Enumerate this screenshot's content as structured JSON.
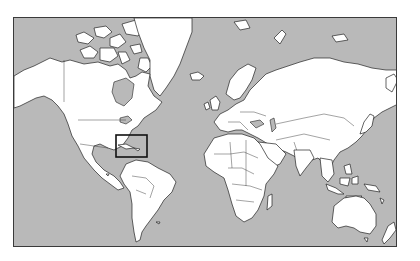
{
  "map": {
    "projection": "mercator",
    "style": "grayscale outline",
    "colors": {
      "ocean": "#b9b9b9",
      "land": "#ffffff",
      "outline": "#222222",
      "frame": "#3a3a3a",
      "highlight": "#111111",
      "page_background": "#ffffff"
    },
    "frame": {
      "x": 13,
      "y": 17,
      "width": 384,
      "height": 230
    },
    "highlight_region": {
      "label": "Caribbean",
      "x": 115,
      "y": 134,
      "width": 31,
      "height": 22
    },
    "landmasses": [
      "North America",
      "Greenland",
      "South America",
      "Europe",
      "Africa",
      "Asia",
      "Australia",
      "Antarctica-none",
      "New Zealand",
      "Madagascar",
      "Japan",
      "Indonesia",
      "United Kingdom",
      "Iceland"
    ]
  }
}
